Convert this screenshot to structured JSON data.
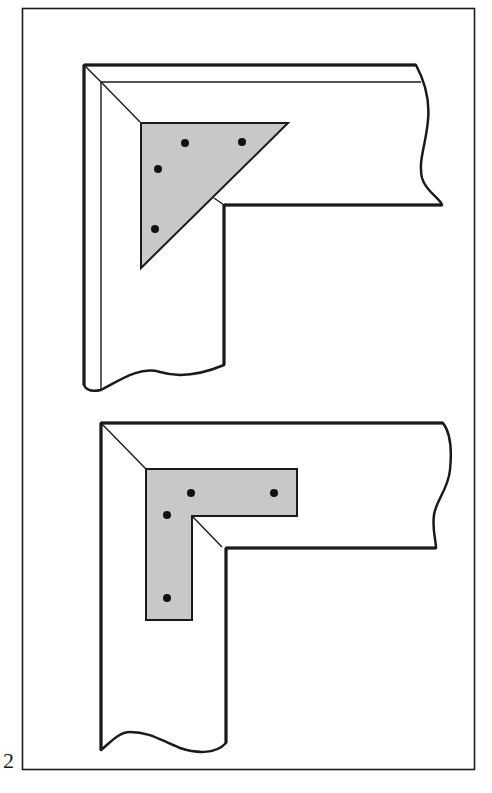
{
  "figure": {
    "number_label": "2",
    "colors": {
      "stroke": "#1a1a1a",
      "plate_fill": "#c8c8c8",
      "background": "#ffffff",
      "screw": "#111111"
    },
    "panels": [
      {
        "name": "triangular-corner-plate-joint",
        "plate_shape": "triangle",
        "screw_count": 4
      },
      {
        "name": "l-shaped-corner-plate-joint",
        "plate_shape": "L",
        "screw_count": 4
      }
    ]
  }
}
